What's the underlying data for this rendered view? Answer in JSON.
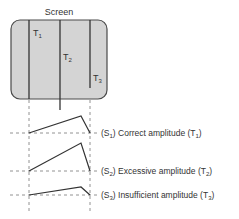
{
  "title": "Screen",
  "trace_labels": {
    "t1": "T",
    "t1_sub": "1",
    "t2": "T",
    "t2_sub": "2",
    "t3": "T",
    "t3_sub": "3"
  },
  "signals": [
    {
      "id": "S1",
      "prefix": "(S",
      "sub": "1",
      "text": ") Correct amplitude (T",
      "tsub": "1",
      "end": ")"
    },
    {
      "id": "S2",
      "prefix": "(S",
      "sub": "2",
      "text": ") Excessive amplitude (T",
      "tsub": "2",
      "end": ")"
    },
    {
      "id": "S3",
      "prefix": "(S",
      "sub": "3",
      "text": ") Insufficient amplitude (T",
      "tsub": "3",
      "end": ")"
    }
  ],
  "colors": {
    "screen_fill": "#d4d4d4",
    "screen_stroke": "#4a4a4a",
    "line": "#333333",
    "dash": "#777777"
  }
}
